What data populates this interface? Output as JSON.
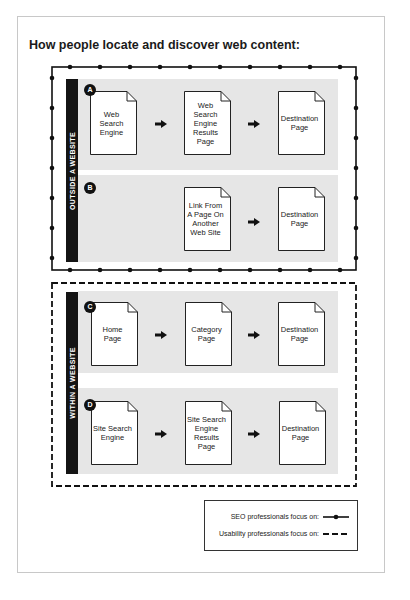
{
  "title": "How people locate and discover web content:",
  "colors": {
    "bar": "#141414",
    "panel": "#e6e6e6",
    "border": "#111111"
  },
  "groups": {
    "outside": {
      "label": "OUTSIDE A WEBSITE",
      "border_style": "SEO (solid line with dots)",
      "paths": [
        {
          "badge": "A",
          "steps": [
            "Web Search Engine",
            "Web Search Engine Results Page",
            "Destination Page"
          ]
        },
        {
          "badge": "B",
          "steps": [
            "Link From A Page On Another Web Site",
            "Destination Page"
          ]
        }
      ]
    },
    "within": {
      "label": "WITHIN A WEBSITE",
      "border_style": "Usability (dashed line)",
      "paths": [
        {
          "badge": "C",
          "steps": [
            "Home Page",
            "Category Page",
            "Destination Page"
          ]
        },
        {
          "badge": "D",
          "steps": [
            "Site Search Engine",
            "Site Search Engine Results Page",
            "Destination Page"
          ]
        }
      ]
    }
  },
  "legend": {
    "seo": "SEO professionals focus on:",
    "usability": "Usability professionals focus on:"
  }
}
